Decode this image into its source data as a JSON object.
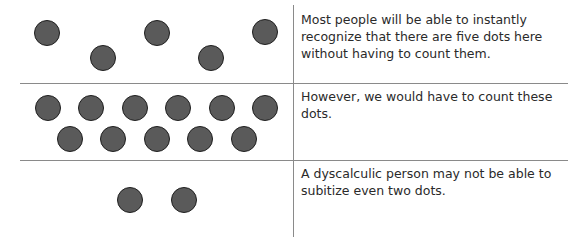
{
  "rows": [
    {
      "caption": "Most people will be able to instantly recognize that there are five dots here without having to count them.",
      "dot_count": 5
    },
    {
      "caption": "However, we would have to count these dots.",
      "dot_count": 11
    },
    {
      "caption": "A dyscalculic person may not be able to subitize even two dots.",
      "dot_count": 2
    }
  ],
  "colors": {
    "dot_fill": "#5a5a5a",
    "dot_outline": "#1e1e1e",
    "divider": "#8a8a8a",
    "text": "#2a2a2a"
  }
}
